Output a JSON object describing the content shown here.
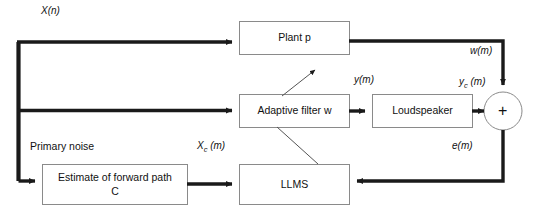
{
  "diagram": {
    "stroke_color": "#1a1a1a",
    "box_border_color": "#8a8a8a",
    "background": "#ffffff",
    "blocks": [
      {
        "id": "plant",
        "label": "Plant p",
        "label_line2": ""
      },
      {
        "id": "adaptive",
        "label": "Adaptive filter w",
        "label_line2": ""
      },
      {
        "id": "speaker",
        "label": "Loudspeaker",
        "label_line2": ""
      },
      {
        "id": "estimate",
        "label": "Estimate of forward path",
        "label_line2": "C"
      },
      {
        "id": "llms",
        "label": "LLMS",
        "label_line2": ""
      }
    ],
    "summing_junction": {
      "operator": "+"
    },
    "signals": [
      {
        "id": "x-n",
        "text": "X(n)",
        "sub": ""
      },
      {
        "id": "w-m",
        "text": "w(m)",
        "sub": ""
      },
      {
        "id": "y-m",
        "text": "y(m)",
        "sub": ""
      },
      {
        "id": "yc-m",
        "text": "y",
        "sub": "c",
        "suffix": " (m)"
      },
      {
        "id": "e-m",
        "text": "e(m)",
        "sub": ""
      },
      {
        "id": "xc-m",
        "text": "X",
        "sub": "c",
        "suffix": " (m)"
      }
    ],
    "annotations": [
      {
        "id": "primary-noise",
        "text": "Primary noise"
      }
    ]
  }
}
